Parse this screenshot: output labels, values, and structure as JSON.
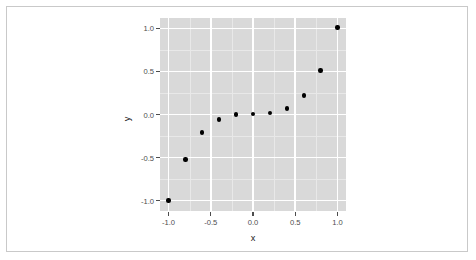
{
  "chart_data": {
    "type": "scatter",
    "title": "",
    "subtitle": "",
    "xlabel": "x",
    "ylabel": "y",
    "xlim": [
      -1.1,
      1.1
    ],
    "ylim": [
      -1.12,
      1.12
    ],
    "grid": true,
    "legend": false,
    "legend_position": "none",
    "panel_background": "#d9d9d9",
    "gridline_color": "#ffffff",
    "point_color": "#000000",
    "x_ticks": [
      -1.0,
      -0.5,
      0.0,
      0.5,
      1.0
    ],
    "x_tick_labels": [
      "-1.0",
      "-0.5",
      "0.0",
      "0.5",
      "1.0"
    ],
    "y_ticks": [
      -1.0,
      -0.5,
      0.0,
      0.5,
      1.0
    ],
    "y_tick_labels": [
      "-1.0",
      "-0.5",
      "0.0",
      "0.5",
      "1.0"
    ],
    "x_minor_ticks": [
      -0.75,
      -0.25,
      0.25,
      0.75
    ],
    "y_minor_ticks": [
      -0.75,
      -0.25,
      0.25,
      0.75
    ],
    "x": [
      -1.0,
      -0.8,
      -0.6,
      -0.4,
      -0.2,
      0.0,
      0.2,
      0.4,
      0.6,
      0.8,
      1.0
    ],
    "y": [
      -1.0,
      -0.52,
      -0.21,
      -0.06,
      0.0,
      0.005,
      0.015,
      0.07,
      0.22,
      0.51,
      1.01
    ],
    "points": [
      {
        "x": -1.0,
        "y": -1.0
      },
      {
        "x": -0.8,
        "y": -0.52
      },
      {
        "x": -0.6,
        "y": -0.21
      },
      {
        "x": -0.4,
        "y": -0.06
      },
      {
        "x": -0.2,
        "y": 0.0
      },
      {
        "x": 0.0,
        "y": 0.005
      },
      {
        "x": 0.2,
        "y": 0.015
      },
      {
        "x": 0.4,
        "y": 0.07
      },
      {
        "x": 0.6,
        "y": 0.22
      },
      {
        "x": 0.8,
        "y": 0.51
      },
      {
        "x": 1.0,
        "y": 1.01
      }
    ]
  }
}
